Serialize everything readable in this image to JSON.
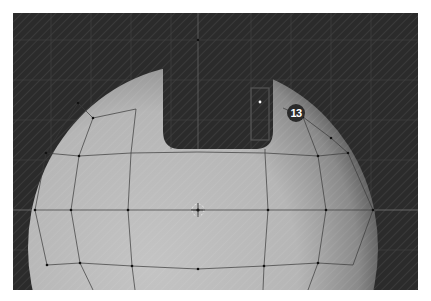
{
  "viewport": {
    "type": "3d-viewport",
    "object": "uv-sphere-with-hole",
    "background_color": "#2b2b2b",
    "mesh_color": "#b8b8b8",
    "annotation": {
      "label": "13",
      "color": "#2a2a2a"
    }
  }
}
